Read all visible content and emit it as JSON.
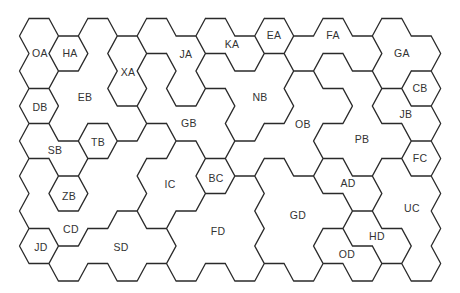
{
  "diagram": {
    "type": "hexagonal-region-map",
    "grid": {
      "columns": 14,
      "rows": 7,
      "origin_x": 39,
      "col_spacing": 29.4,
      "even_origin_y": 36,
      "odd_origin_y": 53.5,
      "row_spacing": 35,
      "hex_half_width": 19.5,
      "hex_half_edge": 10,
      "hex_half_height": 17.5
    },
    "hex_regions": [
      [
        "OA",
        "OA",
        "DB",
        "SB",
        "CD",
        "CD",
        "JD"
      ],
      [
        "HA",
        "EB",
        "EB",
        "SB",
        "ZB",
        "CD",
        "SD"
      ],
      [
        "EB",
        "EB",
        "EB",
        "TB",
        "CD",
        "CD",
        "SD"
      ],
      [
        "XA",
        "XA",
        "EB",
        "CD",
        "CD",
        "SD",
        "SD"
      ],
      [
        "JA",
        "GB",
        "GB",
        "CD",
        "IC",
        "IC",
        "SD"
      ],
      [
        "JA",
        "JA",
        "GB",
        "IC",
        "IC",
        "FD",
        "FD"
      ],
      [
        "KA",
        "NB",
        "GB",
        "GB",
        "BC",
        "FD",
        "FD"
      ],
      [
        "KA",
        "NB",
        "NB",
        "OB",
        "FD",
        "FD",
        "FD"
      ],
      [
        "EA",
        "NB",
        "NB",
        "OB",
        "GD",
        "GD",
        "GD"
      ],
      [
        "FA",
        "OB",
        "OB",
        "OB",
        "GD",
        "GD",
        "GD"
      ],
      [
        "FA",
        "PB",
        "OB",
        "PB",
        "AD",
        "GD",
        "OD"
      ],
      [
        "FA",
        "PB",
        "PB",
        "PB",
        "AD",
        "HD",
        "OD"
      ],
      [
        "GA",
        "GA",
        "JB",
        "PB",
        "UC",
        "UC",
        "HD"
      ],
      [
        "GA",
        "CB",
        "JB",
        "FC",
        "UC",
        "UC",
        "UC"
      ]
    ],
    "line_color": "#2a2a2a",
    "label_color": "#333333",
    "labels": [
      {
        "id": "OA",
        "text": "OA",
        "x": 40,
        "y": 53
      },
      {
        "id": "HA",
        "text": "HA",
        "x": 70,
        "y": 53
      },
      {
        "id": "XA",
        "text": "XA",
        "x": 128,
        "y": 72
      },
      {
        "id": "JA",
        "text": "JA",
        "x": 186,
        "y": 54
      },
      {
        "id": "KA",
        "text": "KA",
        "x": 232,
        "y": 44
      },
      {
        "id": "EA",
        "text": "EA",
        "x": 274,
        "y": 35
      },
      {
        "id": "FA",
        "text": "FA",
        "x": 333,
        "y": 35
      },
      {
        "id": "GA",
        "text": "GA",
        "x": 402,
        "y": 53
      },
      {
        "id": "CB",
        "text": "CB",
        "x": 420,
        "y": 88
      },
      {
        "id": "JB",
        "text": "JB",
        "x": 406,
        "y": 114
      },
      {
        "id": "EB",
        "text": "EB",
        "x": 85,
        "y": 97
      },
      {
        "id": "DB",
        "text": "DB",
        "x": 40,
        "y": 107
      },
      {
        "id": "NB",
        "text": "NB",
        "x": 260,
        "y": 97
      },
      {
        "id": "GB",
        "text": "GB",
        "x": 189,
        "y": 123
      },
      {
        "id": "OB",
        "text": "OB",
        "x": 303,
        "y": 124
      },
      {
        "id": "PB",
        "text": "PB",
        "x": 362,
        "y": 139
      },
      {
        "id": "TB",
        "text": "TB",
        "x": 98,
        "y": 142
      },
      {
        "id": "SB",
        "text": "SB",
        "x": 55,
        "y": 150
      },
      {
        "id": "FC",
        "text": "FC",
        "x": 420,
        "y": 158
      },
      {
        "id": "BC",
        "text": "BC",
        "x": 216,
        "y": 178
      },
      {
        "id": "IC",
        "text": "IC",
        "x": 170,
        "y": 184
      },
      {
        "id": "AD",
        "text": "AD",
        "x": 348,
        "y": 183
      },
      {
        "id": "ZB",
        "text": "ZB",
        "x": 69,
        "y": 196
      },
      {
        "id": "UC",
        "text": "UC",
        "x": 412,
        "y": 208
      },
      {
        "id": "GD",
        "text": "GD",
        "x": 298,
        "y": 215
      },
      {
        "id": "CD",
        "text": "CD",
        "x": 71,
        "y": 229
      },
      {
        "id": "FD",
        "text": "FD",
        "x": 218,
        "y": 231
      },
      {
        "id": "HD",
        "text": "HD",
        "x": 377,
        "y": 236
      },
      {
        "id": "JD",
        "text": "JD",
        "x": 41,
        "y": 247
      },
      {
        "id": "SD",
        "text": "SD",
        "x": 121,
        "y": 247
      },
      {
        "id": "OD",
        "text": "OD",
        "x": 347,
        "y": 254
      }
    ]
  }
}
